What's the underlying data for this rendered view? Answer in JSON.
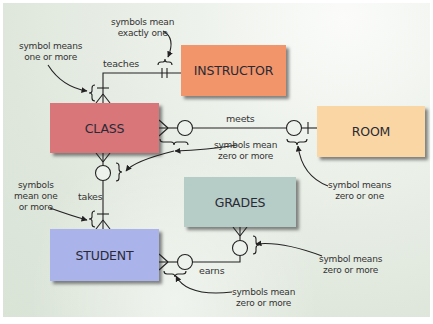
{
  "diagram": {
    "type": "entity-relationship",
    "colors": {
      "background": "#dfe7dc",
      "instructor": "#f2956a",
      "class": "#d8767a",
      "room": "#f9d6a3",
      "grades": "#b6ccc7",
      "student": "#aab3ea",
      "line": "#222222"
    },
    "entities": {
      "instructor": "INSTRUCTOR",
      "class": "CLASS",
      "room": "ROOM",
      "grades": "GRADES",
      "student": "STUDENT"
    },
    "relationships": {
      "teaches": "teaches",
      "meets": "meets",
      "takes": "takes",
      "earns": "earns"
    },
    "annotations": {
      "exactly_one": [
        "symbols mean",
        "exactly one"
      ],
      "one_or_more_top": [
        "symbol means",
        "one or more"
      ],
      "zero_or_more_class_room": [
        "symbols mean",
        "zero or more"
      ],
      "zero_or_one_room": [
        "symbol means",
        "zero or one"
      ],
      "one_or_more_takes": [
        "symbols",
        "mean one",
        "or more"
      ],
      "zero_or_more_grades": [
        "symbol means",
        "zero or more"
      ],
      "zero_or_more_earns": [
        "symbols mean",
        "zero or more"
      ]
    },
    "edges": [
      {
        "from": "INSTRUCTOR",
        "to": "CLASS",
        "label": "teaches",
        "from_cardinality": "exactly one",
        "to_cardinality": "one or more"
      },
      {
        "from": "CLASS",
        "to": "ROOM",
        "label": "meets",
        "from_cardinality": "zero or more",
        "to_cardinality": "zero or one"
      },
      {
        "from": "CLASS",
        "to": "STUDENT",
        "label": "takes",
        "from_cardinality": "zero or more",
        "to_cardinality": "one or more"
      },
      {
        "from": "STUDENT",
        "to": "GRADES",
        "label": "earns",
        "from_cardinality": "zero or more",
        "to_cardinality": "zero or more"
      }
    ]
  }
}
